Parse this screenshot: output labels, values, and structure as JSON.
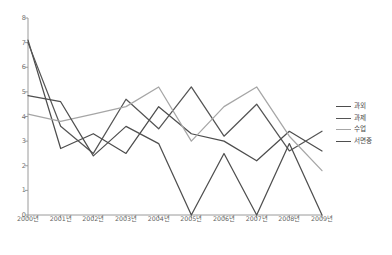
{
  "chart_data": {
    "type": "line",
    "title": "",
    "xlabel": "",
    "ylabel": "",
    "ylim": [
      0,
      8
    ],
    "yticks": [
      0,
      1,
      2,
      3,
      4,
      5,
      6,
      7,
      8
    ],
    "grid": false,
    "legend_position": "right",
    "categories": [
      "2000년",
      "2001년",
      "2002년",
      "2003년",
      "2004년",
      "2005년",
      "2006년",
      "2007년",
      "2008년",
      "2009년"
    ],
    "series": [
      {
        "name": "과외",
        "color": "#4d4d4d",
        "values": [
          7.1,
          2.7,
          3.3,
          2.5,
          4.4,
          3.3,
          3.0,
          2.2,
          3.4,
          2.6
        ]
      },
      {
        "name": "과제",
        "color": "#555555",
        "values": [
          7.0,
          3.6,
          2.5,
          4.7,
          3.5,
          5.2,
          3.2,
          4.5,
          2.6,
          3.4
        ]
      },
      {
        "name": "수업",
        "color": "#a6a6a6",
        "values": [
          4.1,
          3.8,
          4.1,
          4.4,
          5.2,
          3.0,
          4.4,
          5.2,
          3.2,
          1.8
        ]
      },
      {
        "name": "서면중",
        "color": "#4f4f4f",
        "values": [
          4.85,
          4.6,
          2.4,
          3.6,
          2.9,
          0.0,
          2.5,
          0.0,
          2.9,
          0.0
        ]
      }
    ]
  },
  "caption": {
    "text": ""
  }
}
